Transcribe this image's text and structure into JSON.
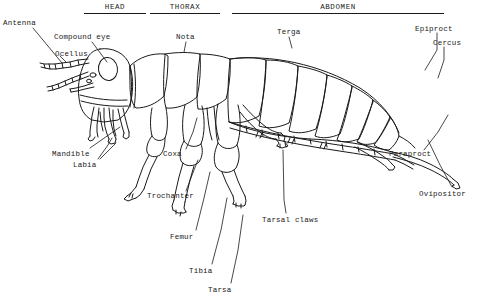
{
  "figure": {
    "type": "line-drawing",
    "ink_color": "#1a1a1a",
    "background_color": "#ffffff",
    "width": 485,
    "height": 299
  },
  "sections": [
    {
      "id": "head",
      "label": "HEAD",
      "text_x": 105,
      "text_y": 3,
      "rule_x": 84,
      "rule_y": 13,
      "rule_w": 62
    },
    {
      "id": "thorax",
      "label": "THORAX",
      "text_x": 158,
      "text_y": 3,
      "rule_x": 150,
      "rule_y": 13,
      "rule_w": 70
    },
    {
      "id": "abdomen",
      "label": "ABDOMEN",
      "text_x": 307,
      "text_y": 3,
      "rule_x": 232,
      "rule_y": 13,
      "rule_w": 212
    }
  ],
  "labels": [
    {
      "id": "antenna",
      "text": "Antenna",
      "x": 3,
      "y": 19
    },
    {
      "id": "ocellus",
      "text": "Ocellus",
      "x": 55,
      "y": 50
    },
    {
      "id": "compound-eye",
      "text": "Compound eye",
      "x": 54,
      "y": 33
    },
    {
      "id": "nota",
      "text": "Nota",
      "x": 176,
      "y": 33
    },
    {
      "id": "terga",
      "text": "Terga",
      "x": 277,
      "y": 28
    },
    {
      "id": "epiproct",
      "text": "Epiproct",
      "x": 415,
      "y": 25
    },
    {
      "id": "cercus",
      "text": "Cercus",
      "x": 433,
      "y": 39
    },
    {
      "id": "mandible",
      "text": "Mandible",
      "x": 52,
      "y": 150
    },
    {
      "id": "labia",
      "text": "Labia",
      "x": 73,
      "y": 161
    },
    {
      "id": "coxa",
      "text": "Coxa",
      "x": 163,
      "y": 150
    },
    {
      "id": "trochanter",
      "text": "Trochanter",
      "x": 147,
      "y": 192
    },
    {
      "id": "femur",
      "text": "Femur",
      "x": 170,
      "y": 233
    },
    {
      "id": "tibia",
      "text": "Tibia",
      "x": 189,
      "y": 267
    },
    {
      "id": "tarsa",
      "text": "Tarsa",
      "x": 208,
      "y": 286
    },
    {
      "id": "tarsal-claws",
      "text": "Tarsal claws",
      "x": 262,
      "y": 216
    },
    {
      "id": "paraproct",
      "text": "Paraproct",
      "x": 389,
      "y": 150
    },
    {
      "id": "ovipositor",
      "text": "Ovipositor",
      "x": 419,
      "y": 190
    }
  ]
}
